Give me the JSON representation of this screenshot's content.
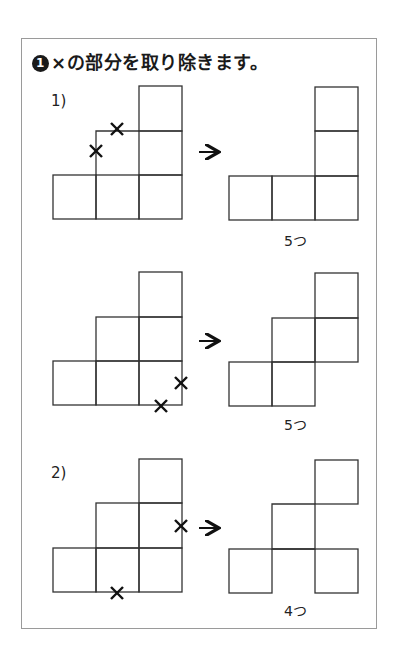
{
  "exercise": {
    "number": "1",
    "number_glyph": "❶",
    "instruction": "×の部分を取り除きます。"
  },
  "problems": [
    {
      "label": "1)",
      "rows": [
        {
          "before": {
            "description": "L-shaped stack with notched inner corner",
            "x_marks": 2
          },
          "after": {
            "count_label": "5つ",
            "count": 5
          }
        },
        {
          "before": {
            "description": "staircase of 6 squares",
            "x_marks": 2
          },
          "after": {
            "count_label": "5つ",
            "count": 5
          }
        }
      ]
    },
    {
      "label": "2)",
      "rows": [
        {
          "before": {
            "description": "staircase of 6 squares",
            "x_marks": 2
          },
          "after": {
            "count_label": "4つ",
            "count": 4
          }
        }
      ]
    }
  ],
  "symbols": {
    "arrow": "→",
    "cross": "×"
  }
}
